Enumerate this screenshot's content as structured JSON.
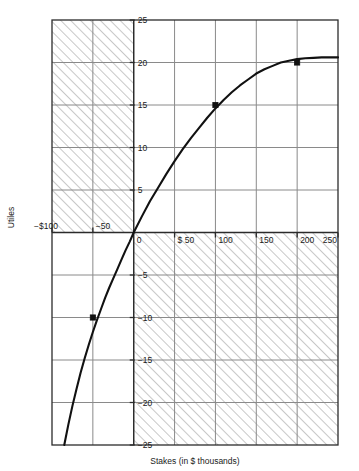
{
  "chart_data": {
    "type": "line",
    "title": "",
    "xlabel": "Stakes (in $ thousands)",
    "ylabel": "Utiles",
    "xlim": [
      -100,
      250
    ],
    "ylim": [
      -25,
      25
    ],
    "grid": true,
    "legend": "none",
    "xticks": [
      -100,
      -50,
      0,
      50,
      100,
      150,
      200,
      250
    ],
    "xtick_labels": [
      "−$100",
      "−50",
      "0",
      "$ 50",
      "100",
      "150",
      "200",
      "250"
    ],
    "yticks": [
      25,
      20,
      15,
      10,
      5,
      -5,
      -10,
      -15,
      -20,
      -25
    ],
    "ytick_labels": [
      "25",
      "20",
      "15",
      "10",
      "5",
      "−5",
      "−10",
      "−15",
      "−20",
      "−25"
    ],
    "series": [
      {
        "name": "utility-curve",
        "x": [
          -85,
          -80,
          -75,
          -70,
          -65,
          -60,
          -55,
          -50,
          -45,
          -40,
          -35,
          -30,
          -25,
          -20,
          -15,
          -10,
          -5,
          0,
          10,
          20,
          30,
          40,
          50,
          60,
          70,
          80,
          90,
          100,
          110,
          120,
          130,
          140,
          150,
          160,
          170,
          180,
          190,
          200,
          210,
          220,
          230,
          240,
          250
        ],
        "y": [
          -25.0,
          -22.6,
          -20.4,
          -18.4,
          -16.5,
          -14.8,
          -13.2,
          -11.7,
          -10.3,
          -9.0,
          -7.7,
          -6.5,
          -5.4,
          -4.3,
          -3.2,
          -2.1,
          -1.1,
          0.0,
          1.9,
          3.7,
          5.3,
          6.9,
          8.4,
          9.8,
          11.1,
          12.3,
          13.5,
          14.6,
          15.6,
          16.5,
          17.3,
          18.0,
          18.7,
          19.2,
          19.6,
          20.0,
          20.2,
          20.4,
          20.5,
          20.55,
          20.6,
          20.6,
          20.6
        ]
      }
    ],
    "marked_points": [
      {
        "x": -50,
        "y": -10
      },
      {
        "x": 100,
        "y": 15
      },
      {
        "x": 200,
        "y": 20
      }
    ],
    "shaded_quadrants": [
      {
        "name": "upper-left-hatched",
        "x0": -100,
        "x1": 0,
        "y0": 0,
        "y1": 25
      },
      {
        "name": "lower-right-hatched",
        "x0": 0,
        "x1": 250,
        "y0": -25,
        "y1": 0
      }
    ],
    "colors": {
      "curve": "#111111",
      "grid": "#8a8a8a",
      "axis": "#2b2b2b",
      "hatch": "#9a9a9a",
      "point": "#111111",
      "background": "#ffffff"
    }
  }
}
